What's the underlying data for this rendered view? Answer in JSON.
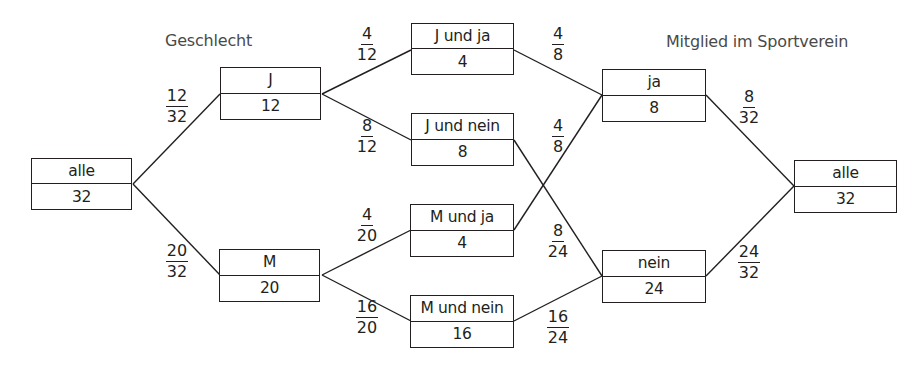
{
  "headings": {
    "left": "Geschlecht",
    "right": "Mitglied im Sportverein"
  },
  "nodes": {
    "root_left": {
      "label": "alle",
      "count": "32"
    },
    "j": {
      "label": "J",
      "count": "12"
    },
    "m": {
      "label": "M",
      "count": "20"
    },
    "j_ja": {
      "label": "J und ja",
      "count": "4"
    },
    "j_nein": {
      "label": "J und nein",
      "count": "8"
    },
    "m_ja": {
      "label": "M und ja",
      "count": "4"
    },
    "m_nein": {
      "label": "M und nein",
      "count": "16"
    },
    "ja": {
      "label": "ja",
      "count": "8"
    },
    "nein": {
      "label": "nein",
      "count": "24"
    },
    "root_right": {
      "label": "alle",
      "count": "32"
    }
  },
  "fractions": {
    "alle_j": {
      "num": "12",
      "den": "32"
    },
    "alle_m": {
      "num": "20",
      "den": "32"
    },
    "j_jja": {
      "num": "4",
      "den": "12"
    },
    "j_jnein": {
      "num": "8",
      "den": "12"
    },
    "m_mja": {
      "num": "4",
      "den": "20"
    },
    "m_mnein": {
      "num": "16",
      "den": "20"
    },
    "jja_ja": {
      "num": "4",
      "den": "8"
    },
    "mja_ja": {
      "num": "4",
      "den": "8"
    },
    "jnein_nein": {
      "num": "8",
      "den": "24"
    },
    "mnein_nein": {
      "num": "16",
      "den": "24"
    },
    "ja_alle": {
      "num": "8",
      "den": "32"
    },
    "nein_alle": {
      "num": "24",
      "den": "32"
    }
  },
  "colors": {
    "stroke": "#231f20",
    "heading_text": "#4a4a4a",
    "background": "#ffffff"
  }
}
